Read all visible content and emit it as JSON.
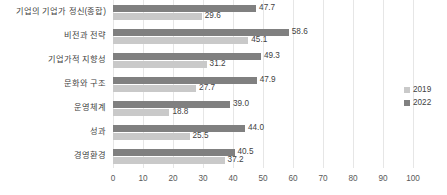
{
  "chart_data": {
    "type": "bar",
    "orientation": "horizontal",
    "title": "",
    "xlabel": "",
    "ylabel": "",
    "xlim": [
      0,
      100
    ],
    "xticks": [
      0,
      10,
      20,
      30,
      40,
      50,
      60,
      70,
      80,
      90,
      100
    ],
    "grid": true,
    "legend_position": "right",
    "categories": [
      "기업의 기업가 정신(종합)",
      "비전과 전략",
      "기업가적 지향성",
      "문화와 구조",
      "운영체계",
      "성과",
      "경영환경"
    ],
    "series": [
      {
        "name": "2022",
        "color": "#808080",
        "values": [
          47.7,
          58.6,
          49.3,
          47.9,
          39.0,
          44.0,
          40.5
        ],
        "labels": [
          "47.7",
          "58.6",
          "49.3",
          "47.9",
          "39.0",
          "44.0",
          "40.5"
        ]
      },
      {
        "name": "2019",
        "color": "#c9c9c9",
        "values": [
          29.6,
          45.1,
          31.2,
          27.7,
          18.8,
          25.5,
          37.2
        ],
        "labels": [
          "29.6",
          "45.1",
          "31.2",
          "27.7",
          "18.8",
          "25.5",
          "37.2"
        ]
      }
    ]
  },
  "legend": {
    "entries": [
      {
        "label": "2019",
        "color": "#c9c9c9"
      },
      {
        "label": "2022",
        "color": "#808080"
      }
    ]
  }
}
